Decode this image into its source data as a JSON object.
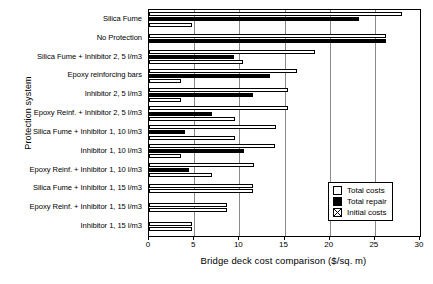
{
  "chart_data": {
    "type": "bar",
    "orientation": "horizontal",
    "title": "",
    "xlabel": "Bridge deck cost comparison ($/sq. m)",
    "ylabel": "Protection system",
    "xlim": [
      0,
      30
    ],
    "xticks": [
      0,
      5,
      10,
      15,
      20,
      25,
      30
    ],
    "grid": true,
    "legend_position": "lower right",
    "categories": [
      "Silica Fume",
      "No Protection",
      "Silica Fume + Inhibitor 2, 5 l/m3",
      "Epoxy reinforcing bars",
      "Inhibitor 2, 5 l/m3",
      "Epoxy Reinf. + Inhibitor 2, 5 l/m3",
      "Silica Fume + Inhibitor 1, 10 l/m3",
      "Inhibitor 1, 10 l/m3",
      "Epoxy Reinf. + Inhibitor 1, 10 l/m3",
      "Silica Fume + Inhibitor 1, 15 l/m3",
      "Epoxy Reinf. + Inhibitor 1, 15 l/m3",
      "Inhibitor 1, 15 l/m3"
    ],
    "series": [
      {
        "name": "Total costs",
        "color": "#ffffff",
        "values": [
          28.0,
          26.2,
          18.4,
          16.4,
          15.4,
          15.4,
          14.1,
          14.0,
          11.6,
          11.5,
          8.6,
          4.8
        ]
      },
      {
        "name": "Total repair",
        "color": "#000000",
        "values": [
          23.2,
          26.2,
          9.4,
          13.4,
          11.5,
          7.0,
          4.0,
          10.5,
          4.4,
          0.0,
          0.0,
          0.0
        ]
      },
      {
        "name": "Initial costs",
        "color": "#ffffff",
        "values": [
          4.8,
          0.0,
          10.4,
          3.5,
          3.5,
          9.5,
          9.5,
          3.5,
          7.0,
          11.5,
          8.6,
          4.8
        ]
      }
    ]
  },
  "legend": {
    "items": [
      {
        "label": "Total costs"
      },
      {
        "label": "Total repair"
      },
      {
        "label": "Initial costs"
      }
    ]
  },
  "axis": {
    "x_title": "Bridge deck cost comparison ($/sq. m)",
    "y_title": "Protection system",
    "x_tick_labels": [
      "0",
      "5",
      "10",
      "15",
      "20",
      "25",
      "30"
    ]
  }
}
